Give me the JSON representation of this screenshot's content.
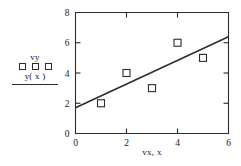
{
  "chart_data": {
    "type": "scatter",
    "title": "",
    "xlabel": "vx, x",
    "ylabel": "",
    "xlim": [
      0,
      6
    ],
    "ylim": [
      0,
      8
    ],
    "xticks": [
      0,
      2,
      4,
      6
    ],
    "yticks": [
      0,
      2,
      4,
      6,
      8
    ],
    "xtick_labels": [
      "0",
      "2",
      "4",
      "6"
    ],
    "ytick_labels": [
      "0",
      "2",
      "4",
      "6",
      "8"
    ],
    "grid": false,
    "legend_position": "left-outside",
    "series": [
      {
        "name": "vy",
        "type": "scatter",
        "marker": "open-square",
        "x": [
          1,
          2,
          3,
          4,
          5
        ],
        "y": [
          2,
          4,
          3,
          6,
          5
        ]
      },
      {
        "name": "y( x )",
        "type": "line",
        "x": [
          0,
          6
        ],
        "y": [
          1.7,
          6.4
        ]
      }
    ]
  },
  "legend": {
    "scatter_label": "vy",
    "line_label": "y( x )"
  },
  "axes": {
    "x_title": "vx, x"
  },
  "colors": {
    "ink": "#2b2b2b",
    "background": "#ffffff"
  }
}
